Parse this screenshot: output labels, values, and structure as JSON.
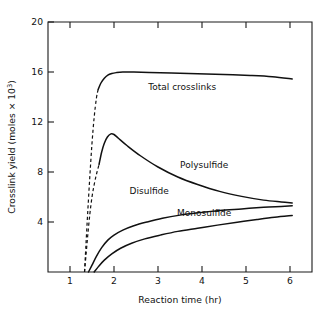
{
  "chart_data": {
    "type": "line",
    "title": "",
    "xlabel": "Reaction time (hr)",
    "ylabel_parts": {
      "main": "Crosslink yield (moles × 10",
      "exponent": "3",
      "close": ")"
    },
    "ylabel": "Crosslink yield (moles × 10³)",
    "xlim": [
      0.5,
      6.5
    ],
    "ylim": [
      0,
      20
    ],
    "xticks": [
      1,
      2,
      3,
      4,
      5,
      6
    ],
    "xtick_labels": [
      "1",
      "2",
      "3",
      "4",
      "5",
      "6"
    ],
    "yticks": [
      4,
      8,
      12,
      16,
      20
    ],
    "ytick_labels": [
      "4",
      "8",
      "12",
      "16",
      "20"
    ],
    "grid": false,
    "legend_position": "inline-annotations",
    "line_color": "#111111",
    "series": [
      {
        "name": "Total crosslinks",
        "label": "Total crosslinks",
        "label_x": 3.55,
        "label_y": 14.6,
        "dashed_segment": {
          "x": [
            1.33,
            1.36,
            1.4,
            1.45,
            1.5,
            1.55,
            1.6,
            1.64
          ],
          "y": [
            0.0,
            2.0,
            4.6,
            7.6,
            10.3,
            12.4,
            13.9,
            14.6
          ]
        },
        "x": [
          1.64,
          1.7,
          1.78,
          1.86,
          1.95,
          2.05,
          2.2,
          2.45,
          2.8,
          3.3,
          3.9,
          4.5,
          5.1,
          5.6,
          6.05
        ],
        "y": [
          14.6,
          15.1,
          15.5,
          15.75,
          15.88,
          15.95,
          16.0,
          16.0,
          15.97,
          15.92,
          15.86,
          15.8,
          15.72,
          15.62,
          15.45
        ]
      },
      {
        "name": "Polysulfide",
        "label": "Polysulfide",
        "label_x": 4.05,
        "label_y": 8.35,
        "dashed_segment": {
          "x": [
            1.33,
            1.36,
            1.4,
            1.45,
            1.5,
            1.55,
            1.6,
            1.66
          ],
          "y": [
            0.0,
            1.2,
            2.8,
            4.6,
            6.0,
            7.0,
            7.8,
            8.6
          ]
        },
        "x": [
          1.66,
          1.72,
          1.78,
          1.85,
          1.93,
          2.0,
          2.1,
          2.3,
          2.6,
          3.0,
          3.45,
          3.9,
          4.4,
          4.9,
          5.4,
          5.8,
          6.05
        ],
        "y": [
          8.6,
          9.6,
          10.3,
          10.8,
          11.05,
          11.0,
          10.7,
          10.1,
          9.3,
          8.4,
          7.6,
          7.0,
          6.45,
          6.05,
          5.75,
          5.6,
          5.52
        ]
      },
      {
        "name": "Disulfide",
        "label": "Disulfide",
        "label_x": 2.8,
        "label_y": 6.25,
        "dashed_segment": null,
        "x": [
          1.42,
          1.5,
          1.6,
          1.72,
          1.86,
          2.0,
          2.2,
          2.45,
          2.75,
          3.1,
          3.5,
          3.95,
          4.4,
          4.9,
          5.4,
          5.8,
          6.05
        ],
        "y": [
          0.0,
          0.55,
          1.25,
          1.95,
          2.55,
          2.95,
          3.35,
          3.7,
          4.0,
          4.3,
          4.55,
          4.75,
          4.92,
          5.05,
          5.18,
          5.25,
          5.3
        ]
      },
      {
        "name": "Monosulfide",
        "label": "Monosulfide",
        "label_x": 4.05,
        "label_y": 4.5,
        "dashed_segment": null,
        "x": [
          1.55,
          1.65,
          1.78,
          1.95,
          2.15,
          2.4,
          2.7,
          3.05,
          3.45,
          3.9,
          4.35,
          4.8,
          5.25,
          5.65,
          6.05
        ],
        "y": [
          0.0,
          0.45,
          0.95,
          1.45,
          1.9,
          2.3,
          2.65,
          2.95,
          3.25,
          3.5,
          3.75,
          3.98,
          4.2,
          4.38,
          4.52
        ]
      }
    ]
  }
}
